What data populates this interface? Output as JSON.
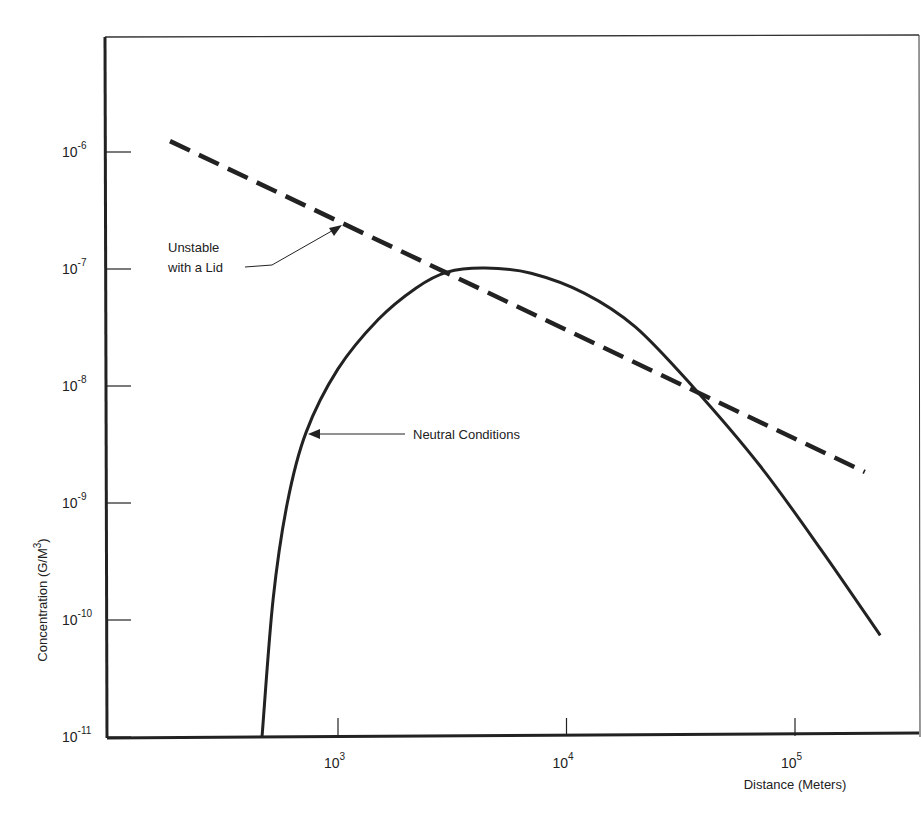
{
  "chart_data": {
    "type": "line",
    "title": "",
    "xlabel": "Distance (Meters)",
    "ylabel": "Concentration (G/M3)",
    "x_scale": "log",
    "y_scale": "log",
    "xlim": [
      95,
      300000
    ],
    "ylim": [
      1e-11,
      3e-06
    ],
    "x_ticks": [
      {
        "value": 1000,
        "base": "10",
        "exp": "3"
      },
      {
        "value": 10000,
        "base": "10",
        "exp": "4"
      },
      {
        "value": 100000,
        "base": "10",
        "exp": "5"
      }
    ],
    "y_ticks": [
      {
        "value": 1e-06,
        "base": "10",
        "exp": "-6"
      },
      {
        "value": 1e-07,
        "base": "10",
        "exp": "-7"
      },
      {
        "value": 1e-08,
        "base": "10",
        "exp": "-8"
      },
      {
        "value": 1e-09,
        "base": "10",
        "exp": "-9"
      },
      {
        "value": 1e-10,
        "base": "10",
        "exp": "-10"
      },
      {
        "value": 1e-11,
        "base": "10",
        "exp": "-11"
      }
    ],
    "grid": false,
    "legend": "none (inline annotations with arrows)",
    "series": [
      {
        "name": "Unstable with a Lid",
        "style": "dashed",
        "x": [
          184,
          1000,
          3000,
          10000,
          35800,
          202000
        ],
        "y": [
          1.24e-06,
          2.6e-07,
          1.05e-07,
          4.1e-08,
          1e-08,
          1.84e-09
        ]
      },
      {
        "name": "Neutral Conditions",
        "style": "solid",
        "x": [
          465,
          520,
          600,
          724,
          1000,
          1500,
          2200,
          3000,
          4400,
          7000,
          12000,
          20000,
          35800,
          70000,
          130000,
          236000
        ],
        "y": [
          1e-11,
          1.5e-10,
          1e-09,
          4e-09,
          1.4e-08,
          3.7e-08,
          6.9e-08,
          9.4e-08,
          1.02e-07,
          9.2e-08,
          6.2e-08,
          3.2e-08,
          9.8e-09,
          2.1e-09,
          4e-10,
          7.4e-11
        ]
      }
    ],
    "annotations": [
      {
        "text_lines": [
          "Unstable",
          "with a Lid"
        ],
        "points_to": "dashed line near x=1000"
      },
      {
        "text": "Neutral Conditions",
        "points_to": "solid curve near x=720"
      }
    ]
  },
  "labels": {
    "x_axis_title": "Distance (Meters)",
    "y_axis_title": "Concentration (G/M",
    "y_axis_title_sup": "3",
    "y_axis_title_close": ")",
    "unstable_line1": "Unstable",
    "unstable_line2": "with a Lid",
    "neutral": "Neutral Conditions"
  }
}
